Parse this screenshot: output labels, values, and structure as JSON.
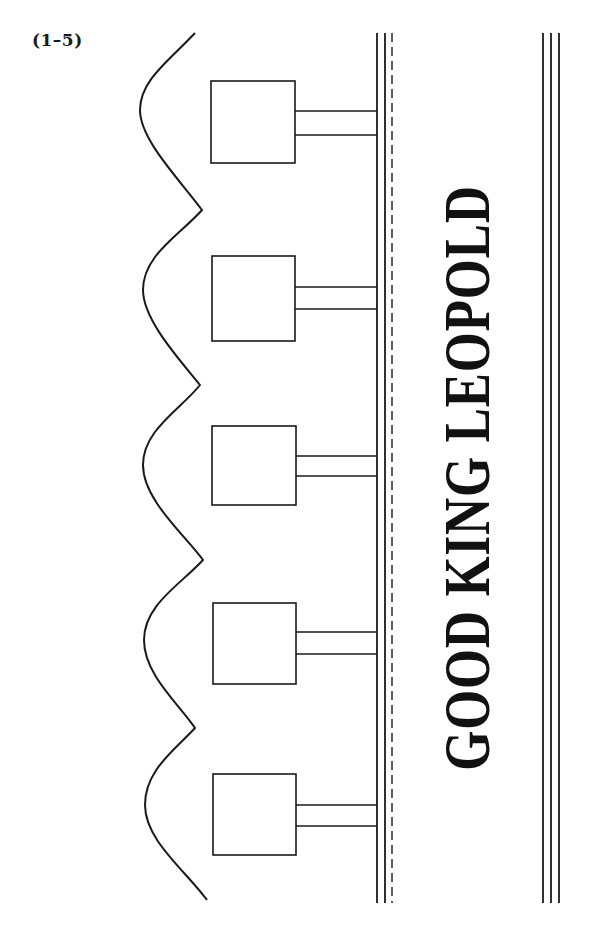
{
  "figure_label": "(1–5)",
  "street_name": "GOOD KING LEOPOLD",
  "colors": {
    "ink": "#1a1a1a",
    "background": "#ffffff"
  },
  "diagram": {
    "shoreline": {
      "description": "wavy scalloped boundary on the left with right-pointing cusps",
      "points": [
        [
          195,
          33
        ],
        [
          140,
          110
        ],
        [
          202,
          210
        ],
        [
          143,
          290
        ],
        [
          200,
          385
        ],
        [
          143,
          465
        ],
        [
          203,
          560
        ],
        [
          144,
          640
        ],
        [
          195,
          728
        ],
        [
          145,
          805
        ],
        [
          207,
          900
        ]
      ]
    },
    "houses": [
      {
        "id": 1,
        "x": 211,
        "y": 81,
        "w": 84,
        "h": 82,
        "path_y": [
          111,
          135
        ]
      },
      {
        "id": 2,
        "x": 212,
        "y": 256,
        "w": 83,
        "h": 85,
        "path_y": [
          287,
          309
        ]
      },
      {
        "id": 3,
        "x": 212,
        "y": 426,
        "w": 84,
        "h": 79,
        "path_y": [
          456,
          476
        ]
      },
      {
        "id": 4,
        "x": 213,
        "y": 603,
        "w": 83,
        "h": 81,
        "path_y": [
          632,
          654
        ]
      },
      {
        "id": 5,
        "x": 213,
        "y": 774,
        "w": 83,
        "h": 81,
        "path_y": [
          805,
          826
        ]
      }
    ],
    "road_left_edge": {
      "solid_x": [
        377,
        385
      ],
      "dashed_x": 392,
      "y_top": 33,
      "y_bottom": 903
    },
    "road_right_edge": {
      "solid_x": [
        543,
        551,
        559
      ],
      "y_top": 33,
      "y_bottom": 903
    }
  }
}
